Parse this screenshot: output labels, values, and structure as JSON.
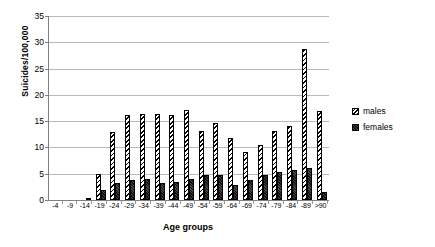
{
  "chart_data": {
    "type": "bar",
    "title": "",
    "xlabel": "Age groups",
    "ylabel": "Suicides/100,000",
    "ylim": [
      0,
      35
    ],
    "ytick_step": 5,
    "yticks": [
      0,
      5,
      10,
      15,
      20,
      25,
      30,
      35
    ],
    "grid": true,
    "legend_position": "right",
    "categories": [
      "-4",
      "-9",
      "-14",
      "-19",
      "-24",
      "-29",
      "-34",
      "-39",
      "-44",
      "-49",
      "-54",
      "-59",
      "-64",
      "-69",
      "-74",
      "-79",
      "-84",
      "-89",
      ">90"
    ],
    "series": [
      {
        "name": "males",
        "values": [
          0,
          0,
          0,
          5.0,
          12.9,
          16.2,
          16.3,
          16.3,
          16.2,
          17.2,
          13.2,
          14.6,
          11.8,
          9.2,
          10.4,
          13.2,
          14.1,
          28.8,
          17.0
        ]
      },
      {
        "name": "females",
        "values": [
          0,
          0,
          0.4,
          2.0,
          3.2,
          3.8,
          4.0,
          3.3,
          3.4,
          4.0,
          4.7,
          4.8,
          2.8,
          3.9,
          4.8,
          5.4,
          5.7,
          6.1,
          1.5
        ]
      }
    ]
  },
  "legend": {
    "items": [
      {
        "label": "males",
        "pattern": "diagonal-hatch",
        "color": "#000000"
      },
      {
        "label": "females",
        "pattern": "solid-dark",
        "color": "#2a2a2a"
      }
    ]
  },
  "axes": {
    "y_title": "Suicides/100,000",
    "x_title": "Age groups"
  }
}
